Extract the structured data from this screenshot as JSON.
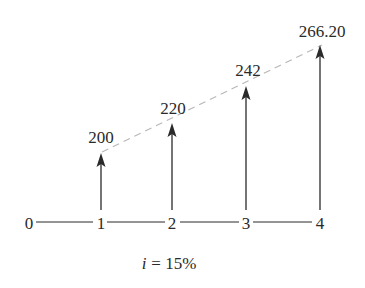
{
  "diagram": {
    "type": "cash-flow-diagram",
    "interest_rate_label": "i = 15%",
    "interest_rate_var": "i",
    "interest_rate_value": "= 15%",
    "periods": [
      "0",
      "1",
      "2",
      "3",
      "4"
    ],
    "cash_flows": [
      {
        "period": 1,
        "amount": "200"
      },
      {
        "period": 2,
        "amount": "220"
      },
      {
        "period": 3,
        "amount": "242"
      },
      {
        "period": 4,
        "amount": "266.20"
      }
    ],
    "trend_line": "dashed",
    "colors": {
      "ink": "#2a2a2a",
      "dash": "#b8b8b8",
      "background": "#ffffff"
    }
  }
}
